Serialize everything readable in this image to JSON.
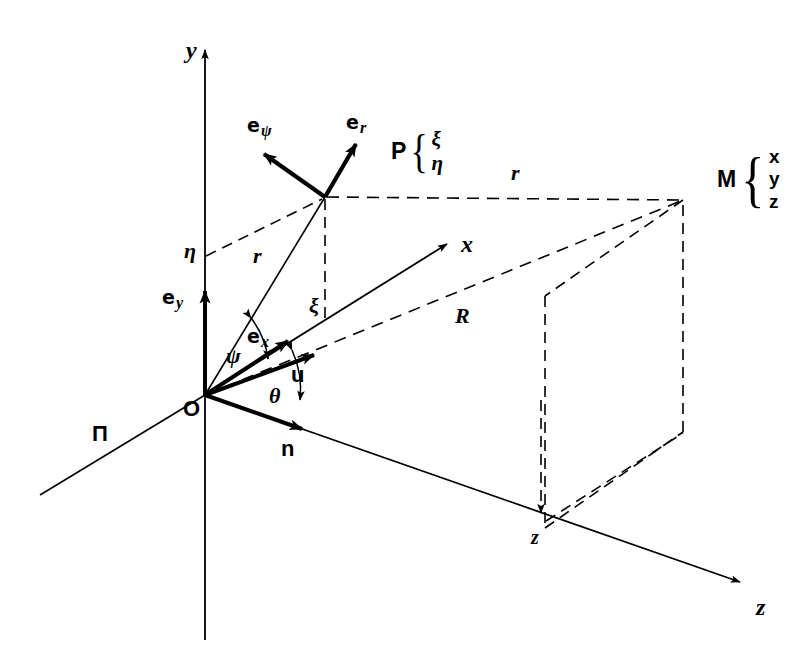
{
  "figure": {
    "background_color": "#ffffff",
    "stroke_color": "#000000",
    "width": 792,
    "height": 668
  },
  "axes": [
    {
      "id": "y-axis",
      "label": "y",
      "style": "italic-serif-bold",
      "x": 186,
      "y": 38,
      "arrow": true
    },
    {
      "id": "x-axis",
      "label": "x",
      "style": "italic-serif-bold",
      "x": 461,
      "y": 232,
      "arrow": true
    },
    {
      "id": "z-axis",
      "label": "z",
      "style": "italic-serif-bold",
      "x": 756,
      "y": 595,
      "arrow": true
    }
  ],
  "points": [
    {
      "id": "origin",
      "label": "O",
      "style": "sans-bold",
      "x": 183,
      "y": 398
    },
    {
      "id": "point-P",
      "label": "P",
      "coords": [
        "ξ",
        "η"
      ]
    },
    {
      "id": "point-M",
      "label": "M",
      "coords": [
        "x",
        "y",
        "z"
      ]
    }
  ],
  "basis_vectors": [
    {
      "id": "e-psi",
      "glyph": "e",
      "subscript": "ψ",
      "x": 247,
      "y": 116
    },
    {
      "id": "e-r",
      "glyph": "e",
      "subscript": "r",
      "x": 346,
      "y": 113
    },
    {
      "id": "e-y",
      "glyph": "e",
      "subscript": "y",
      "x": 162,
      "y": 288
    },
    {
      "id": "e-x",
      "glyph": "e",
      "subscript": "x",
      "x": 247,
      "y": 327
    }
  ],
  "vectors": [
    {
      "id": "u-vector",
      "label": "u",
      "style": "sans-bold",
      "x": 291,
      "y": 364
    },
    {
      "id": "n-vector",
      "label": "n",
      "style": "sans-bold",
      "x": 281,
      "y": 438
    }
  ],
  "angles": [
    {
      "id": "angle-psi",
      "label": "ψ",
      "style": "italic-serif-bold",
      "x": 226,
      "y": 345
    },
    {
      "id": "angle-theta",
      "label": "θ",
      "style": "italic-serif-bold",
      "x": 269,
      "y": 385
    }
  ],
  "distances": [
    {
      "id": "r-from-origin",
      "label": "r",
      "style": "italic-serif-bold",
      "x": 253,
      "y": 245
    },
    {
      "id": "r-to-M",
      "label": "r",
      "style": "italic-serif-bold",
      "x": 511,
      "y": 162
    },
    {
      "id": "R-to-M",
      "label": "R",
      "style": "italic-serif-bold",
      "x": 455,
      "y": 305
    }
  ],
  "coordinate_labels": [
    {
      "id": "eta-label",
      "label": "η",
      "style": "italic-serif-bold",
      "x": 184,
      "y": 240
    },
    {
      "id": "xi-label",
      "label": "ξ",
      "style": "italic-serif-bold",
      "x": 309,
      "y": 295
    },
    {
      "id": "z-drop-label",
      "label": "z",
      "style": "italic-serif-bold",
      "x": 531,
      "y": 527
    }
  ],
  "plane_labels": [
    {
      "id": "plane-pi",
      "label": "Π",
      "style": "sans-bold",
      "x": 92,
      "y": 423
    }
  ],
  "point_P_group": {
    "name": "P",
    "items": [
      "ξ",
      "η"
    ],
    "x": 391,
    "y": 128
  },
  "point_M_group": {
    "name": "M",
    "items": [
      "x",
      "y",
      "z"
    ],
    "x": 717,
    "y": 146
  }
}
